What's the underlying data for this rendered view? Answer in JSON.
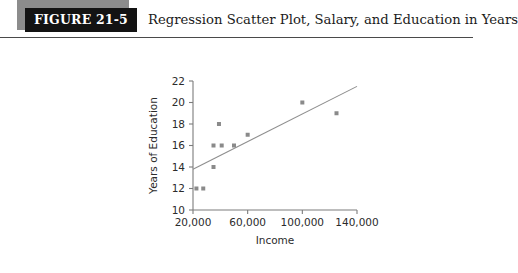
{
  "figure": {
    "tag": "FIGURE 21-5",
    "title": "Regression Scatter Plot, Salary, and Education in Years"
  },
  "colors": {
    "tag_background": "#131313",
    "tag_shadow": "#8c8c8c",
    "tag_text": "#ffffff",
    "rule": "#4a4a4a",
    "axis": "#7c7c7c",
    "point": "#8a8a8a",
    "regression_line": "#8e8e8e",
    "page_background": "#ffffff"
  },
  "chart_data": {
    "type": "scatter",
    "title": "Regression Scatter Plot, Salary, and Education in Years",
    "xlabel": "Income",
    "ylabel": "Years of Education",
    "xlim": [
      20000,
      140000
    ],
    "ylim": [
      10,
      22
    ],
    "xticks": [
      20000,
      60000,
      100000,
      140000
    ],
    "xtick_labels": [
      "20,000",
      "60,000",
      "100,000",
      "140,000"
    ],
    "yticks": [
      10,
      12,
      14,
      16,
      18,
      20,
      22
    ],
    "ytick_labels": [
      "10",
      "12",
      "14",
      "16",
      "18",
      "20",
      "22"
    ],
    "grid": false,
    "legend": null,
    "series": [
      {
        "name": "Observations",
        "points": [
          {
            "x": 22500,
            "y": 12
          },
          {
            "x": 27500,
            "y": 12
          },
          {
            "x": 35000,
            "y": 14
          },
          {
            "x": 35000,
            "y": 16
          },
          {
            "x": 41000,
            "y": 16
          },
          {
            "x": 39000,
            "y": 18
          },
          {
            "x": 50000,
            "y": 16
          },
          {
            "x": 60000,
            "y": 17
          },
          {
            "x": 100000,
            "y": 20
          },
          {
            "x": 125000,
            "y": 19
          }
        ]
      }
    ],
    "regression_line": {
      "name": "Least-squares fit",
      "x_start": 20000,
      "y_start": 13.8,
      "x_end": 140000,
      "y_end": 21.5
    }
  }
}
